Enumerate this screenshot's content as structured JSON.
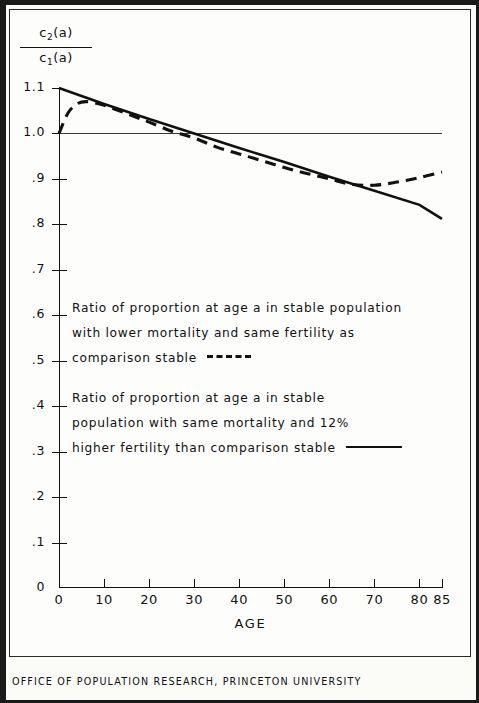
{
  "figure": {
    "y_axis_title_numerator": "c2(a)",
    "y_axis_title_denominator": "c1(a)",
    "x_axis_title": "AGE",
    "footer": "OFFICE OF POPULATION RESEARCH, PRINCETON UNIVERSITY"
  },
  "legend": {
    "dashed": {
      "line1": "Ratio of proportion at age a in stable population",
      "line2": "with lower mortality and same fertility as",
      "line3": "comparison stable",
      "style": "dashed"
    },
    "solid": {
      "line1": "Ratio of proportion  at age  a  in stable",
      "line2": "population with same mortality and 12%",
      "line3": "higher fertility than comparison stable",
      "style": "solid"
    }
  },
  "chart_data": {
    "type": "line",
    "title": "",
    "subtitle": "",
    "xlabel": "AGE",
    "ylabel": "c2(a) / c1(a)",
    "xlim": [
      0,
      85
    ],
    "ylim": [
      0,
      1.1
    ],
    "grid": false,
    "legend_position": "inside-center",
    "x_ticks": [
      0,
      10,
      20,
      30,
      40,
      50,
      60,
      70,
      80,
      85
    ],
    "x_tick_labels": [
      "0",
      "10",
      "20",
      "30",
      "40",
      "50",
      "60",
      "70",
      "80",
      "85"
    ],
    "y_ticks": [
      0,
      0.1,
      0.2,
      0.3,
      0.4,
      0.5,
      0.6,
      0.7,
      0.8,
      0.9,
      1.0,
      1.1
    ],
    "y_tick_labels": [
      "0",
      ".1",
      ".2",
      ".3",
      ".4",
      ".5",
      ".6",
      ".7",
      ".8",
      ".9",
      "1.0",
      "1.1"
    ],
    "reference_lines": [
      {
        "orientation": "horizontal",
        "value": 1.0,
        "style": "solid-thin"
      }
    ],
    "annotations": [
      {
        "text": "Solid line crosses ratio 1.0 at about age 30",
        "x": 30,
        "y": 1.0
      }
    ],
    "series": [
      {
        "name": "Ratio of proportion at age a in stable population with lower mortality and same fertility as comparison stable",
        "style": "dashed",
        "x": [
          0,
          2,
          4,
          6,
          9,
          12,
          16,
          20,
          25,
          30,
          35,
          40,
          45,
          50,
          55,
          60,
          65,
          70,
          75,
          80,
          85
        ],
        "y": [
          1.0,
          1.045,
          1.065,
          1.07,
          1.065,
          1.055,
          1.04,
          1.025,
          1.005,
          0.99,
          0.97,
          0.955,
          0.94,
          0.925,
          0.912,
          0.9,
          0.888,
          0.886,
          0.893,
          0.903,
          0.915
        ]
      },
      {
        "name": "Ratio of proportion at age a in stable population with same mortality and 12% higher fertility than comparison stable",
        "style": "solid",
        "x": [
          0,
          10,
          20,
          30,
          40,
          50,
          60,
          70,
          80,
          85
        ],
        "y": [
          1.1,
          1.065,
          1.032,
          1.0,
          0.968,
          0.937,
          0.905,
          0.874,
          0.843,
          0.812
        ]
      }
    ]
  }
}
